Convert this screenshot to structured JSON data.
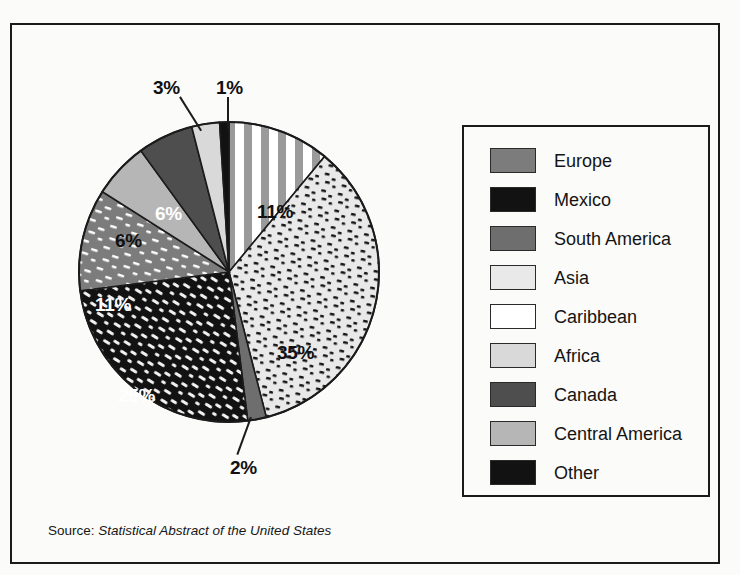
{
  "frame": {
    "present": true
  },
  "source": {
    "prefix": "Source:",
    "title": "Statistical Abstract of the United States"
  },
  "legend": {
    "items": [
      {
        "label": "Europe",
        "pattern": "gray-with-white-dashes"
      },
      {
        "label": "Mexico",
        "pattern": "black-with-white-dashes"
      },
      {
        "label": "South America",
        "pattern": "solid-medium-gray"
      },
      {
        "label": "Asia",
        "pattern": "light-with-black-dashes"
      },
      {
        "label": "Caribbean",
        "pattern": "vertical-gray-white-stripes"
      },
      {
        "label": "Africa",
        "pattern": "solid-light-gray"
      },
      {
        "label": "Canada",
        "pattern": "solid-dark-gray"
      },
      {
        "label": "Central America",
        "pattern": "solid-light-medium-gray"
      },
      {
        "label": "Other",
        "pattern": "solid-black"
      }
    ]
  },
  "chart_data": {
    "type": "pie",
    "title": "",
    "xlabel": "",
    "ylabel": "",
    "units": "percent",
    "start_angle_deg": 0,
    "direction": "clockwise",
    "categories": [
      "Caribbean",
      "Asia",
      "South America",
      "Mexico",
      "Europe",
      "Central America",
      "Canada",
      "Africa",
      "Other"
    ],
    "values": [
      11,
      35,
      2,
      25,
      11,
      6,
      6,
      3,
      1
    ],
    "labels": [
      "11%",
      "35%",
      "2%",
      "25%",
      "11%",
      "6%",
      "6%",
      "3%",
      "1%"
    ],
    "slices": [
      {
        "name": "Caribbean",
        "value": 11,
        "label": "11%",
        "label_color": "#111111",
        "label_placement": "inside",
        "pattern": "vertical-gray-white-stripes"
      },
      {
        "name": "Asia",
        "value": 35,
        "label": "35%",
        "label_color": "#111111",
        "label_placement": "inside",
        "pattern": "light-with-black-dashes"
      },
      {
        "name": "South America",
        "value": 2,
        "label": "2%",
        "label_color": "#111111",
        "label_placement": "outside",
        "pattern": "solid-medium-gray"
      },
      {
        "name": "Mexico",
        "value": 25,
        "label": "25%",
        "label_color": "#ffffff",
        "label_placement": "inside",
        "pattern": "black-with-white-dashes"
      },
      {
        "name": "Europe",
        "value": 11,
        "label": "11%",
        "label_color": "#ffffff",
        "label_placement": "inside",
        "pattern": "gray-with-white-dashes"
      },
      {
        "name": "Central America",
        "value": 6,
        "label": "6%",
        "label_color": "#111111",
        "label_placement": "inside",
        "pattern": "solid-light-medium-gray"
      },
      {
        "name": "Canada",
        "value": 6,
        "label": "6%",
        "label_color": "#ffffff",
        "label_placement": "inside",
        "pattern": "solid-dark-gray"
      },
      {
        "name": "Africa",
        "value": 3,
        "label": "3%",
        "label_color": "#111111",
        "label_placement": "outside",
        "pattern": "solid-light-gray"
      },
      {
        "name": "Other",
        "value": 1,
        "label": "1%",
        "label_color": "#111111",
        "label_placement": "outside",
        "pattern": "solid-black"
      }
    ],
    "legend_position": "right",
    "grid": false
  },
  "colors": {
    "ink": "#1b1b1b",
    "paper": "#fbfbfa",
    "gray_medium": "#808080",
    "gray_dark": "#4a4a4a",
    "gray_light": "#d8d8d8",
    "gray_light_medium": "#b4b4b4",
    "light_dot_bg": "#e8e8e8",
    "black": "#111111",
    "white": "#ffffff"
  }
}
